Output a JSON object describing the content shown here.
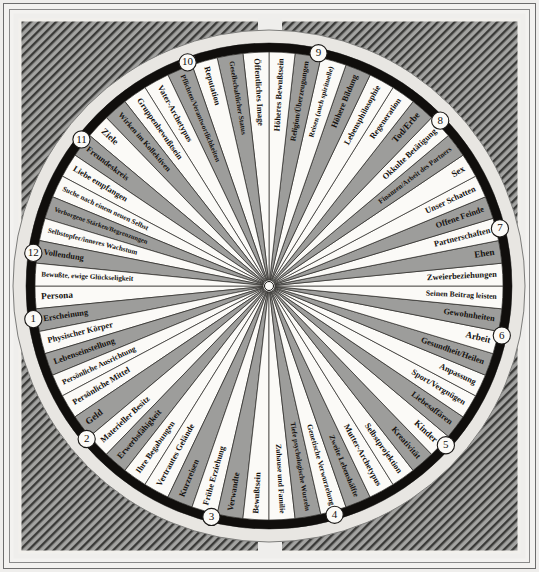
{
  "diagram": {
    "kind": "astrological-house-wheel",
    "language": "de",
    "center_marker": "white-dot",
    "colors": {
      "sector_white": "#fbfaf7",
      "sector_gray": "#9d9d9b",
      "rim_black": "#100e0c",
      "rim_light": "#e8e6e2",
      "hatch_gray": "#8f8f8d",
      "page_bg": "#efeeec",
      "ink": "#15120f"
    },
    "geometry": {
      "cx": 269,
      "cy": 286,
      "outer_radius": 256,
      "inner_radius": 6,
      "ring_black_width": 9,
      "ring_light_width": 13
    }
  },
  "houses": [
    {
      "number": "1",
      "marker_angle": 172,
      "start_angle": 180,
      "end_angle": 152,
      "sectors": [
        "Persona",
        "Erscheinung",
        "Physischer Körper",
        "Lebenseinstellung",
        "Persönliche Ausrichtung"
      ]
    },
    {
      "number": "2",
      "marker_angle": 140,
      "start_angle": 152,
      "end_angle": 122,
      "sectors": [
        "Persönliche Mittel",
        "Geld",
        "Materieller Besitz",
        "Erwerbsfähigkeit",
        "Ihre Begabungen"
      ]
    },
    {
      "number": "3",
      "marker_angle": 104,
      "start_angle": 122,
      "end_angle": 90,
      "sectors": [
        "Vertrautes Gelände",
        "Kurzreisen",
        "Frühe Erziehung",
        "Verwandte",
        "Bewußtsein"
      ]
    },
    {
      "number": "4",
      "marker_angle": 74,
      "start_angle": 90,
      "end_angle": 58,
      "sectors": [
        "Zuhause und Familie",
        "Tiefe psychologische Wurzeln",
        "Genetische Verwurzelung",
        "Zweite Lebenshälfte",
        "Mutter-Archetypus"
      ]
    },
    {
      "number": "5",
      "marker_angle": 42,
      "start_angle": 58,
      "end_angle": 28,
      "sectors": [
        "Selbstprojektion",
        "Kreativität",
        "Kinder",
        "Liebesaffären",
        "Sport/Vergnügen"
      ]
    },
    {
      "number": "6",
      "marker_angle": 12,
      "start_angle": 28,
      "end_angle": 0,
      "sectors": [
        "Anpassung",
        "Gesundheit/Heilen",
        "Arbeit",
        "Gewohnheiten",
        "Seinen Beitrag leisten"
      ]
    },
    {
      "number": "7",
      "marker_angle": -14,
      "start_angle": 0,
      "end_angle": -28,
      "sectors": [
        "Zweierbeziehungen",
        "Ehen",
        "Partnerschaften",
        "Offene Feinde",
        "Unser Schatten"
      ]
    },
    {
      "number": "8",
      "marker_angle": -44,
      "start_angle": -28,
      "end_angle": -58,
      "sectors": [
        "Sex",
        "Finanzen/Arbeit des Partners",
        "Okkulte Betätigung",
        "Tod/Erbe",
        "Regeneration"
      ]
    },
    {
      "number": "9",
      "marker_angle": -78,
      "start_angle": -58,
      "end_angle": -90,
      "sectors": [
        "Lebensphilosophie",
        "Höhere Bildung",
        "Reisen (auch spirituelle)",
        "Religion/Überzeugungen",
        "Höheres Bewußtsein"
      ]
    },
    {
      "number": "10",
      "marker_angle": -110,
      "start_angle": -90,
      "end_angle": -122,
      "sectors": [
        "Öffentliches Image",
        "Gesellschaftlicher Status",
        "Reputation",
        "Pflichten/Verantwortlichkeiten",
        "Vater-Archetypus"
      ]
    },
    {
      "number": "11",
      "marker_angle": -142,
      "start_angle": -122,
      "end_angle": -152,
      "sectors": [
        "Gruppenbewußtsein",
        "Wirken im Kollektiven",
        "Ziele",
        "Freundeskreis",
        "Liebe empfangen"
      ]
    },
    {
      "number": "12",
      "marker_angle": -172,
      "start_angle": -152,
      "end_angle": -180,
      "sectors": [
        "Suche nach einem neuen Selbst",
        "Verborgene Stärken/Begrenzungen",
        "Selbstopfer/inneres Wachstum",
        "Vollendung",
        "Bewußte, ewige Glückseligkeit"
      ]
    }
  ]
}
